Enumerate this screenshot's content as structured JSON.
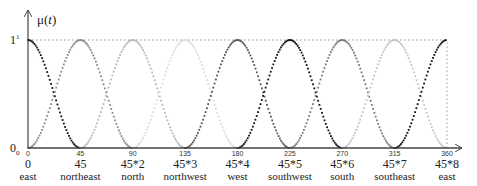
{
  "chart_data": {
    "type": "line",
    "title": "",
    "ylabel": "μ(t)",
    "xlabel": "",
    "xlim": [
      0,
      360
    ],
    "ylim": [
      0,
      1
    ],
    "grid": false,
    "legend": null,
    "y_ticks": [
      {
        "value": 0,
        "label": "0",
        "sub": "0"
      },
      {
        "value": 1,
        "label": "1",
        "sup": "1"
      }
    ],
    "x_ticks": [
      {
        "value": 0,
        "small": "0",
        "main": "0",
        "name": "east"
      },
      {
        "value": 45,
        "small": "45",
        "main": "45",
        "name": "northeast"
      },
      {
        "value": 90,
        "small": "90",
        "main": "45*2",
        "name": "north"
      },
      {
        "value": 135,
        "small": "135",
        "main": "45*3",
        "name": "northwest"
      },
      {
        "value": 180,
        "small": "180",
        "main": "45*4",
        "name": "west"
      },
      {
        "value": 225,
        "small": "225",
        "main": "45*5",
        "name": "southwest"
      },
      {
        "value": 270,
        "small": "270",
        "main": "45*6",
        "name": "south"
      },
      {
        "value": 315,
        "small": "315",
        "main": "45*7",
        "name": "southeast"
      },
      {
        "value": 360,
        "small": "360",
        "main": "45*8",
        "name": "east"
      }
    ],
    "series": [
      {
        "name": "east (0)",
        "center": 0,
        "halfwidth": 45,
        "shape": "raised-cosine",
        "color": "#111111"
      },
      {
        "name": "northeast (45)",
        "center": 45,
        "halfwidth": 45,
        "shape": "raised-cosine",
        "color": "#8a8a8a"
      },
      {
        "name": "north (90)",
        "center": 90,
        "halfwidth": 45,
        "shape": "raised-cosine",
        "color": "#b8b8b8"
      },
      {
        "name": "northwest (135)",
        "center": 135,
        "halfwidth": 45,
        "shape": "raised-cosine",
        "color": "#dcdcdc"
      },
      {
        "name": "west (180)",
        "center": 180,
        "halfwidth": 45,
        "shape": "raised-cosine",
        "color": "#555555"
      },
      {
        "name": "southwest (225)",
        "center": 225,
        "halfwidth": 45,
        "shape": "raised-cosine",
        "color": "#111111"
      },
      {
        "name": "south (270)",
        "center": 270,
        "halfwidth": 45,
        "shape": "raised-cosine",
        "color": "#7a7a7a"
      },
      {
        "name": "southeast (315)",
        "center": 315,
        "halfwidth": 45,
        "shape": "raised-cosine",
        "color": "#c4c4c4"
      },
      {
        "name": "east (360)",
        "center": 360,
        "halfwidth": 45,
        "shape": "raised-cosine",
        "color": "#111111"
      }
    ],
    "reference_lines": [
      {
        "type": "horizontal-dotted",
        "y": 1,
        "from": 0,
        "to": 360
      },
      {
        "type": "vertical-dotted",
        "x": 360,
        "from": 0,
        "to": 1
      }
    ]
  }
}
